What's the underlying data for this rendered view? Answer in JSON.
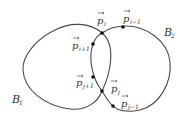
{
  "diagram": {
    "regions": [
      {
        "id": "B1",
        "label": "B",
        "subscript": "1"
      },
      {
        "id": "B2",
        "label": "B",
        "subscript": "2"
      }
    ],
    "points": [
      {
        "id": "p_i",
        "label": "p",
        "subscript": "i",
        "vector": true,
        "role": "intersection"
      },
      {
        "id": "p_i-1",
        "label": "p",
        "subscript": "i−1",
        "vector": true,
        "role": "on B2 boundary"
      },
      {
        "id": "p_i+1",
        "label": "p",
        "subscript": "i+1",
        "vector": true,
        "role": "on B2 boundary"
      },
      {
        "id": "p_j+1",
        "label": "p",
        "subscript": "j+1",
        "vector": true,
        "role": "on B2 boundary"
      },
      {
        "id": "p_j",
        "label": "p",
        "subscript": "j",
        "vector": true,
        "role": "intersection"
      },
      {
        "id": "p_j-1",
        "label": "p",
        "subscript": "j−1",
        "vector": true,
        "role": "on B2 boundary"
      }
    ]
  }
}
